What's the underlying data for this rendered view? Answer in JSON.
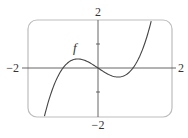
{
  "chart_data": {
    "type": "line",
    "title": "",
    "xlabel": "",
    "ylabel": "",
    "xlim": [
      -2,
      2
    ],
    "ylim": [
      -2,
      2
    ],
    "grid": false,
    "legend": null,
    "tick_labels": {
      "x_left": "−2",
      "x_right": "2",
      "y_top": "2",
      "y_bottom": "−2"
    },
    "y_minor_ticks": [
      1,
      -1
    ],
    "series": [
      {
        "name": "f",
        "label": "f",
        "expression": "x^3 - x",
        "x": [
          -1.53,
          -1.25,
          -1.0,
          -0.75,
          -0.577,
          -0.5,
          -0.25,
          0.0,
          0.25,
          0.5,
          0.577,
          0.75,
          1.0,
          1.25,
          1.52
        ],
        "y": [
          -2.05,
          -0.7,
          0.0,
          0.33,
          0.385,
          0.375,
          0.23,
          0.0,
          -0.23,
          -0.375,
          -0.385,
          -0.33,
          0.0,
          0.7,
          2.0
        ]
      }
    ],
    "annotations": [
      {
        "text": "f",
        "x": -0.65,
        "y": 0.85,
        "style": "italic"
      }
    ],
    "colors": {
      "curve": "#444444",
      "axes": "#555555",
      "frame": "#bbbbbb"
    }
  },
  "labels": {
    "function_name": "f",
    "x_min": "−2",
    "x_max": "2",
    "y_max": "2",
    "y_min": "−2"
  }
}
